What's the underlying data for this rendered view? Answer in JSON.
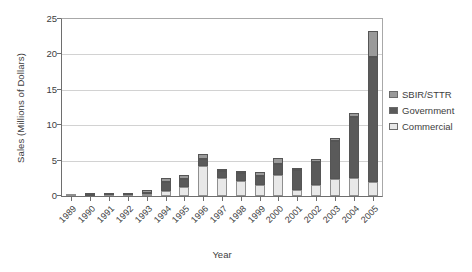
{
  "chart_data": {
    "type": "bar",
    "stacked": true,
    "title": "",
    "xlabel": "Year",
    "ylabel": "Sales (Millions of Dollars)",
    "ylim": [
      0,
      25
    ],
    "yticks": [
      0,
      5,
      10,
      15,
      20,
      25
    ],
    "grid": true,
    "legend_position": "right",
    "categories": [
      "1989",
      "1990",
      "1991",
      "1992",
      "1993",
      "1994",
      "1995",
      "1996",
      "1997",
      "1998",
      "1999",
      "2000",
      "2001",
      "2002",
      "2003",
      "2004",
      "2005"
    ],
    "stack_order_bottom_to_top": [
      "Commercial",
      "Government",
      "SBIR/STTR"
    ],
    "series": [
      {
        "name": "SBIR/STTR",
        "color": "#9a9a9a",
        "values": [
          0.0,
          0.05,
          0.1,
          0.05,
          0.45,
          0.5,
          0.6,
          0.8,
          0.35,
          0.35,
          0.6,
          0.9,
          0.35,
          0.4,
          0.4,
          0.6,
          3.6
        ]
      },
      {
        "name": "Government",
        "color": "#5a5a5a",
        "values": [
          0.0,
          0.05,
          0.1,
          0.05,
          0.2,
          1.3,
          1.1,
          0.9,
          0.9,
          1.1,
          1.3,
          1.6,
          2.8,
          3.2,
          5.4,
          8.5,
          17.7
        ]
      },
      {
        "name": "Commercial",
        "color": "#e8e8e8",
        "values": [
          0.05,
          0.05,
          0.1,
          0.1,
          0.25,
          0.7,
          1.3,
          4.3,
          2.6,
          2.1,
          1.5,
          2.9,
          0.85,
          1.6,
          2.4,
          2.6,
          2.0
        ]
      }
    ],
    "totals": [
      0.05,
      0.15,
      0.3,
      0.2,
      0.9,
      2.5,
      3.0,
      6.0,
      3.85,
      3.55,
      3.4,
      5.4,
      4.0,
      5.2,
      8.2,
      11.7,
      23.3
    ]
  },
  "legend": {
    "items": [
      {
        "label": "SBIR/STTR",
        "color": "#9a9a9a"
      },
      {
        "label": "Government",
        "color": "#5a5a5a"
      },
      {
        "label": "Commercial",
        "color": "#e8e8e8"
      }
    ]
  },
  "axes": {
    "y_title": "Sales (Millions of Dollars)",
    "x_title": "Year",
    "y_tick_labels": [
      "0",
      "5",
      "10",
      "15",
      "20",
      "25"
    ]
  }
}
